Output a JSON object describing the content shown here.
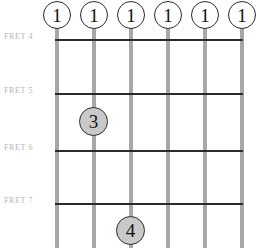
{
  "diagram": {
    "colors": {
      "string": "#a8a8a8",
      "fret_line": "#2b2b2b",
      "fret_label_text": "#b5b5b5",
      "nut_marker_fill": "#ffffff",
      "finger_marker_fill": "#c9c9c9",
      "marker_outline": "#2b2b2b",
      "marker_text": "#111111",
      "background": "#ffffff"
    },
    "strings": [
      {
        "index": 1,
        "x": 55
      },
      {
        "index": 2,
        "x": 92
      },
      {
        "index": 3,
        "x": 129
      },
      {
        "index": 4,
        "x": 166
      },
      {
        "index": 5,
        "x": 203
      },
      {
        "index": 6,
        "x": 240
      }
    ],
    "fret_lines": [
      {
        "label": "FRET 4",
        "y": 39,
        "label_y": 33
      },
      {
        "label": "FRET 5",
        "y": 93,
        "label_y": 87
      },
      {
        "label": "FRET 6",
        "y": 150,
        "label_y": 144
      },
      {
        "label": "FRET 7",
        "y": 203,
        "label_y": 197
      }
    ],
    "nut_markers": [
      {
        "finger": "1",
        "string": 1,
        "cx": 57,
        "cy": 15
      },
      {
        "finger": "1",
        "string": 2,
        "cx": 94,
        "cy": 15
      },
      {
        "finger": "1",
        "string": 3,
        "cx": 131,
        "cy": 15
      },
      {
        "finger": "1",
        "string": 4,
        "cx": 168,
        "cy": 15
      },
      {
        "finger": "1",
        "string": 5,
        "cx": 205,
        "cy": 15
      },
      {
        "finger": "1",
        "string": 6,
        "cx": 242,
        "cy": 15
      }
    ],
    "finger_markers": [
      {
        "finger": "3",
        "string": 2,
        "fret": 5,
        "cx": 94,
        "cy": 122
      },
      {
        "finger": "4",
        "string": 3,
        "fret": 7,
        "cx": 131,
        "cy": 231
      }
    ]
  }
}
